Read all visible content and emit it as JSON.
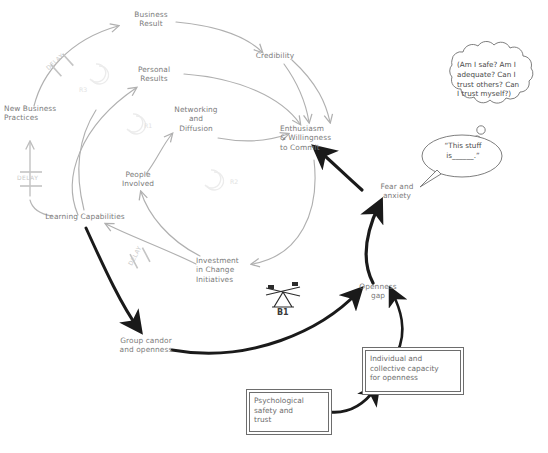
{
  "diagram": {
    "colors": {
      "gray_link": "#b0b0b0",
      "bold_link": "#1a1a1a",
      "node_text": "#7b7b7b",
      "box_border": "#6d6d6d",
      "faint_loop": "#e2e2e2",
      "delay_text": "#c9c9c9"
    },
    "nodes": [
      {
        "id": "business-result",
        "label": "Business\nResult"
      },
      {
        "id": "credibility",
        "label": "Credibility"
      },
      {
        "id": "personal-results",
        "label": "Personal\nResults"
      },
      {
        "id": "networking-diffusion",
        "label": "Networking\nand\nDiffusion"
      },
      {
        "id": "enthusiasm",
        "label": "Enthusiasm\n& Willingness\nto Commit"
      },
      {
        "id": "people-involved",
        "label": "People\nInvolved"
      },
      {
        "id": "new-business-practices",
        "label": "New Business\nPractices"
      },
      {
        "id": "learning-capabilities",
        "label": "Learning Capabilities"
      },
      {
        "id": "investment",
        "label": "Investment\nin Change\nInitiatives"
      },
      {
        "id": "group-candor",
        "label": "Group candor\nand openness"
      },
      {
        "id": "openness-gap",
        "label": "Openness\ngap"
      },
      {
        "id": "fear-anxiety",
        "label": "Fear and\nanxiety"
      }
    ],
    "boxes": [
      {
        "id": "capacity-box",
        "label": "Individual and\ncollective capacity\nfor openness"
      },
      {
        "id": "safety-box",
        "label": "Psychological\nsafety and\ntrust"
      }
    ],
    "bubbles": {
      "thought": "(Am I safe? Am I\nadequate? Can I\ntrust others? Can\nI trust myself?)",
      "speech": "“This stuff\n  is______.”"
    },
    "loop_labels": [
      {
        "id": "r3",
        "label": "R3"
      },
      {
        "id": "r1",
        "label": "R1"
      },
      {
        "id": "r2",
        "label": "R2"
      }
    ],
    "balance_label": "B1",
    "delay_labels": [
      {
        "id": "delay-top",
        "label": "DELAY"
      },
      {
        "id": "delay-left",
        "label": "DELAY"
      },
      {
        "id": "delay-investment",
        "label": "DELAY"
      }
    ]
  }
}
